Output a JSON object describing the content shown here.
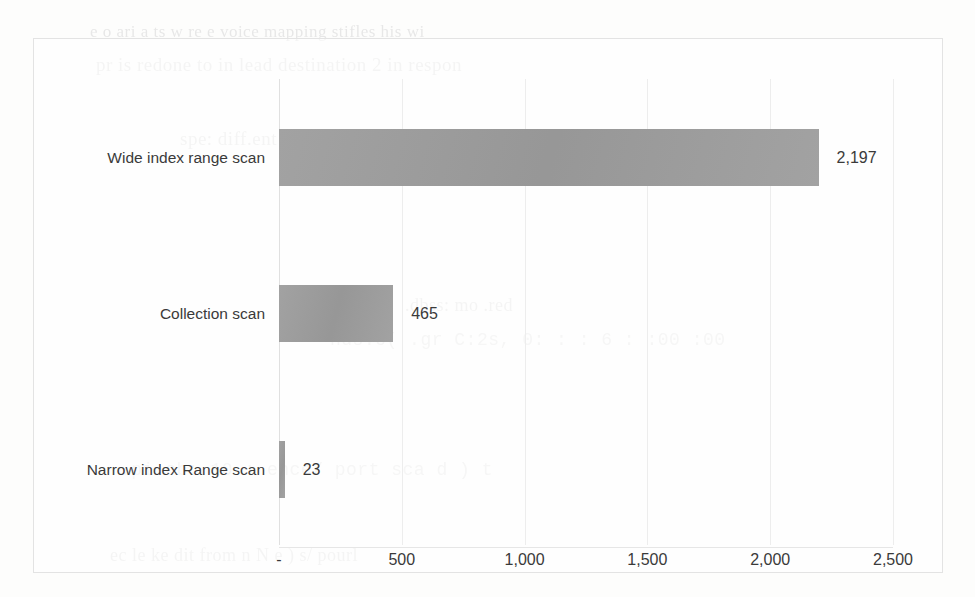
{
  "chart_data": {
    "type": "bar",
    "orientation": "horizontal",
    "title": "",
    "xlabel": "",
    "ylabel": "",
    "categories": [
      "Wide index range scan",
      "Collection scan",
      "Narrow index Range scan"
    ],
    "values": [
      2197,
      465,
      23
    ],
    "value_labels": [
      "2,197",
      "465",
      "23"
    ],
    "xlim": [
      0,
      2500
    ],
    "xticks": [
      0,
      500,
      1000,
      1500,
      2000,
      2500
    ],
    "xtick_labels": [
      "-",
      "500",
      "1,000",
      "1,500",
      "2,000",
      "2,500"
    ],
    "grid": "vertical",
    "legend": "none",
    "series": [
      {
        "name": "",
        "values": [
          2197,
          465,
          23
        ]
      }
    ],
    "colors": {
      "bar": "#9d9d9d",
      "gridline": "#ededed",
      "border": "#e3e3e3",
      "text": "#3a3a3a",
      "background": "#ffffff"
    }
  },
  "bars": [
    {
      "label": "Wide index range scan",
      "value": 2197,
      "value_label": "2,197"
    },
    {
      "label": "Collection scan",
      "value": 465,
      "value_label": "465"
    },
    {
      "label": "Narrow index Range scan",
      "value": 23,
      "value_label": "23"
    }
  ],
  "axis": {
    "ticks": [
      {
        "value": 0,
        "label": "-"
      },
      {
        "value": 500,
        "label": "500"
      },
      {
        "value": 1000,
        "label": "1,000"
      },
      {
        "value": 1500,
        "label": "1,500"
      },
      {
        "value": 2000,
        "label": "2,000"
      },
      {
        "value": 2500,
        "label": "2,500"
      }
    ]
  },
  "page_showthrough": [
    {
      "text": "e o ari a ts  w re e  voice  mapping stifles his  wi",
      "left": 90,
      "top": 22,
      "size": 17
    },
    {
      "text": "pr    is  redone  to  in lead  destination  2  in    respon",
      "left": 96,
      "top": 54,
      "size": 19
    },
    {
      "text": "spe: diff.ent  reso   te  sco a(  ')  ( .ert  lo  ation\")",
      "left": 180,
      "top": 128,
      "size": 19
    },
    {
      "text": ".dbss:  mo  .red",
      "left": 405,
      "top": 295,
      "size": 18
    },
    {
      "text": "nds.o( .gr   C:2s, 0: :  : 6 :  :00 :00",
      "left": 330,
      "top": 330,
      "size": 18
    },
    {
      "text": ".pi   ob: 10   : ence/ port  sca  d )   t",
      "left": 120,
      "top": 460,
      "size": 18
    },
    {
      "text": "ec   le  ke dit   from   n   N   e  )  s/ pourl",
      "left": 110,
      "top": 545,
      "size": 18
    }
  ]
}
